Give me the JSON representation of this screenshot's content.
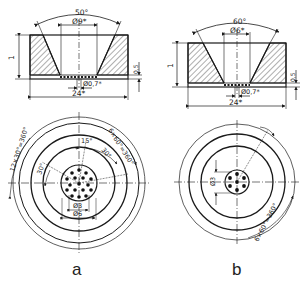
{
  "figure": {
    "panels": [
      {
        "id": "a",
        "caption": "a",
        "section": {
          "cone_angle": "50°",
          "top_diameter": "Ø9*",
          "height": "1",
          "bottom_layer": "0,5",
          "hole_diameter": "Ø0,7*",
          "overall_width": "24*"
        },
        "plan": {
          "outer_pattern": "12×30°=360°",
          "inner_pattern": "6×60°=360°",
          "angle_small": "15°",
          "angle_a": "30°",
          "angle_b": "30°",
          "inner_diameter": "Ø3",
          "outer_diameter": "Ø6"
        }
      },
      {
        "id": "b",
        "caption": "b",
        "section": {
          "cone_angle": "60°",
          "top_diameter": "Ø6*",
          "height": "1",
          "bottom_layer": "0,5",
          "hole_diameter": "Ø0,7*",
          "overall_width": "24*"
        },
        "plan": {
          "pattern": "6×60°=360°",
          "inner_diameter": "Ø3"
        }
      }
    ],
    "colors": {
      "line": "#1a1a1a",
      "background": "#ffffff"
    }
  }
}
